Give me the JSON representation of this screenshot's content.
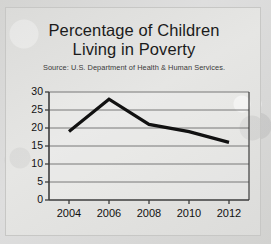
{
  "slide": {
    "title_line1": "Percentage of Children",
    "title_line2": "Living in Poverty",
    "source": "Source: U.S. Department of Health & Human Services."
  },
  "colors": {
    "background": "#d9d9d7",
    "panel": "#e2e2e0",
    "line": "#111111",
    "grid": "#6b6b6b",
    "axis": "#3c3c3c",
    "text": "#111111"
  },
  "chart_data": {
    "type": "line",
    "title": "Percentage of Children Living in Poverty",
    "subtitle": "Source: U.S. Department of Health & Human Services.",
    "xlabel": "",
    "ylabel": "",
    "x": [
      2004,
      2006,
      2008,
      2010,
      2012
    ],
    "values": [
      19,
      28,
      21,
      19,
      16
    ],
    "series": [
      {
        "name": "Percentage of children living in poverty",
        "values": [
          19,
          28,
          21,
          19,
          16
        ]
      }
    ],
    "xticks": [
      "2004",
      "2006",
      "2008",
      "2010",
      "2012"
    ],
    "yticks": [
      "0",
      "5",
      "10",
      "15",
      "20",
      "25",
      "30"
    ],
    "ylim": [
      0,
      30
    ],
    "xlim": [
      2003,
      2013
    ],
    "grid": "horizontal",
    "legend": "none"
  }
}
